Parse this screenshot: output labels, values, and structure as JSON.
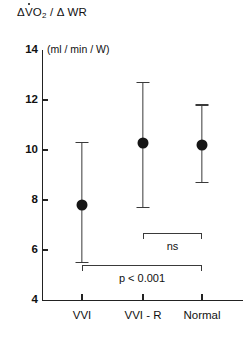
{
  "chart_data": {
    "type": "scatter",
    "title_parts": {
      "delta1": "Δ",
      "v": "V",
      "o": "O",
      "sub2": "2",
      "slash": " / ",
      "delta2": "Δ",
      "wr": " WR"
    },
    "subtitle": "(ml / min / W)",
    "xlabel": "",
    "ylabel": "Δ V̇O₂ / Δ WR",
    "yunits": "ml / min / W",
    "ylim": [
      4,
      14
    ],
    "yticks": [
      14,
      12,
      10,
      8,
      6,
      4
    ],
    "ytick_labels": [
      "14",
      "12",
      "10",
      "8",
      "6",
      "4"
    ],
    "grid": false,
    "legend": "none",
    "error_bar_type": "mean ± SD",
    "categories": [
      "VVI",
      "VVI - R",
      "Normal"
    ],
    "values": [
      7.8,
      10.3,
      10.2
    ],
    "err_upper": [
      10.3,
      12.7,
      11.8
    ],
    "err_lower": [
      5.5,
      7.7,
      8.7
    ],
    "points": [
      {
        "label": "VVI",
        "mean": 7.8,
        "upper": 10.3,
        "lower": 5.5
      },
      {
        "label": "VVI - R",
        "mean": 10.3,
        "upper": 12.7,
        "lower": 7.7
      },
      {
        "label": "Normal",
        "mean": 10.2,
        "upper": 11.8,
        "lower": 8.7
      }
    ],
    "annotations": [
      {
        "text": "ns",
        "from": "VVI - R",
        "to": "Normal"
      },
      {
        "text": "p < 0.001",
        "from": "VVI",
        "to": "Normal"
      }
    ],
    "colors": {
      "marker": "#151515",
      "error_bar": "#3a3a3a",
      "axis": "#222222",
      "background": "#ffffff"
    }
  }
}
